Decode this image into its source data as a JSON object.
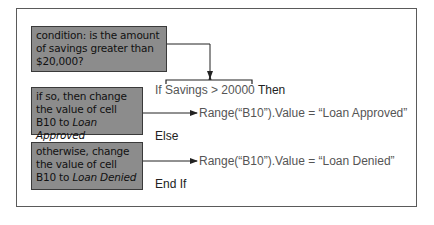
{
  "notes": {
    "condition": "condition: is the amount of savings greater than $20,000?",
    "if_so_prefix": "if so, then change the value of cell B10 to ",
    "if_so_value": "Loan Approved",
    "otherwise_prefix": "otherwise, change the value of cell B10 to ",
    "otherwise_value": "Loan Denied"
  },
  "code": {
    "if_line": "If Savings > 20000",
    "then_kw": "Then",
    "approved_line": "Range(“B10”).Value = “Loan Approved”",
    "else_kw": "Else",
    "denied_line": "Range(“B10”).Value = “Loan Denied”",
    "endif_kw": "End If"
  },
  "colors": {
    "note_fill": "#8c8c8c",
    "note_border": "#3a3a3a",
    "code_text": "#555555",
    "frame": "#5a5a5a"
  }
}
